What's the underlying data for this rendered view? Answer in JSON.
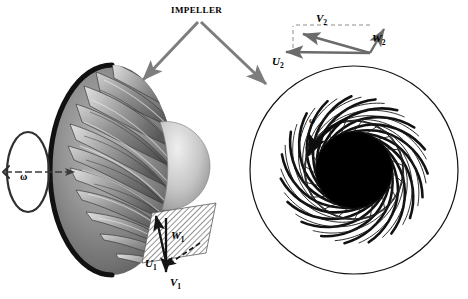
{
  "figure": {
    "background_color": "#ffffff",
    "width": 468,
    "height": 299,
    "title_label": "IMPELLER"
  },
  "labels": {
    "impeller": "IMPELLER",
    "omega_shaft": "ω",
    "omega_plan": "ω",
    "v1": "V",
    "v1_sub": "1",
    "u1": "U",
    "u1_sub": "1",
    "w1": "W",
    "w1_sub": "1",
    "v2": "V",
    "v2_sub": "2",
    "u2": "U",
    "u2_sub": "2",
    "w2": "W",
    "w2_sub": "2"
  },
  "views": {
    "left_view": {
      "name": "three-dimensional impeller photograph",
      "shroud_edge_color": "#1a1a1a",
      "blade_color": "#8a8a8a",
      "hub_cone_color": "#c8c8c8"
    },
    "right_view": {
      "name": "plan view of impeller blade cascade",
      "outline_color": "#000000",
      "hub_fill": "#000000",
      "blade_count": 19,
      "splitter_count": 19
    }
  },
  "vectors": {
    "outlet_triangle": {
      "absolute_velocity": "V2",
      "blade_speed": "U2",
      "relative_velocity": "W2",
      "color": "#6b6b6b"
    },
    "inlet_triangle": {
      "absolute_velocity": "V1",
      "blade_speed": "U1",
      "relative_velocity": "W1",
      "color": "#1a1a1a"
    }
  },
  "leaders": {
    "color": "#7d7d7d",
    "count": 2
  }
}
